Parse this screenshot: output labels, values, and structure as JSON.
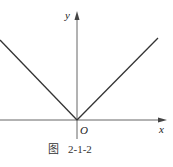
{
  "figure": {
    "caption_prefix": "图",
    "caption_number": "2-1-2",
    "axes": {
      "x_label": "x",
      "y_label": "y",
      "origin_label": "O"
    },
    "graph": {
      "description": "V-shaped graph of y = |x| with vertex at origin",
      "function": "y = |x|",
      "line_color": "#333333",
      "axis_color": "#666666"
    }
  }
}
